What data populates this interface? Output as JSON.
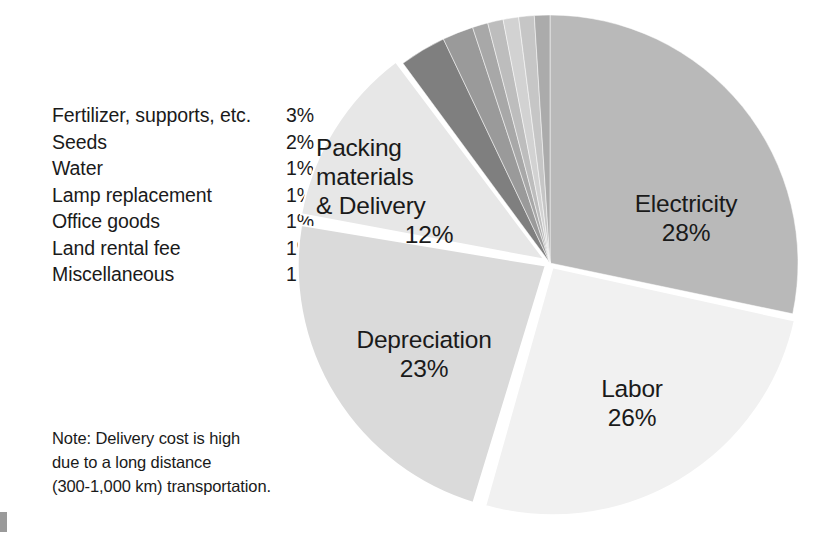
{
  "chart_data": {
    "type": "pie",
    "title": "",
    "unit": "%",
    "legend_position": "left",
    "categories": [
      "Electricity",
      "Labor",
      "Depreciation",
      "Packing materials & Delivery",
      "Fertilizer, supports, etc.",
      "Seeds",
      "Water",
      "Lamp replacement",
      "Office goods",
      "Land rental fee",
      "Miscellaneous"
    ],
    "values": [
      28,
      26,
      23,
      12,
      3,
      2,
      1,
      1,
      1,
      1,
      1
    ],
    "labels": [
      "28%",
      "26%",
      "23%",
      "12%",
      "3%",
      "2%",
      "1%",
      "1%",
      "1%",
      "1%",
      "1%"
    ],
    "colors": [
      "#b9b9b9",
      "#f1f1f1",
      "#dadada",
      "#e7e7e7",
      "#7f7f7f",
      "#9a9a9a",
      "#a8a8a8",
      "#bdbdbd",
      "#d2d2d2",
      "#c6c6c6",
      "#ababab"
    ],
    "slices": [
      {
        "name": "Electricity",
        "value": 28,
        "label": "28%",
        "color": "#b9b9b9"
      },
      {
        "name": "Labor",
        "value": 26,
        "label": "26%",
        "color": "#f1f1f1"
      },
      {
        "name": "Depreciation",
        "value": 23,
        "label": "23%",
        "color": "#dadada"
      },
      {
        "name": "Packing materials & Delivery",
        "value": 12,
        "label": "12%",
        "color": "#e7e7e7"
      },
      {
        "name": "Fertilizer, supports, etc.",
        "value": 3,
        "label": "3%",
        "color": "#7f7f7f"
      },
      {
        "name": "Seeds",
        "value": 2,
        "label": "2%",
        "color": "#9a9a9a"
      },
      {
        "name": "Water",
        "value": 1,
        "label": "1%",
        "color": "#a8a8a8"
      },
      {
        "name": "Lamp replacement",
        "value": 1,
        "label": "1%",
        "color": "#bdbdbd"
      },
      {
        "name": "Office goods",
        "value": 1,
        "label": "1%",
        "color": "#d2d2d2"
      },
      {
        "name": "Land rental fee",
        "value": 1,
        "label": "1%",
        "color": "#c6c6c6"
      },
      {
        "name": "Miscellaneous",
        "value": 1,
        "label": "1%",
        "color": "#ababab"
      }
    ]
  },
  "legend": {
    "rows": [
      {
        "label": "Fertilizer, supports, etc.",
        "value": "3%"
      },
      {
        "label": "Seeds",
        "value": "2%"
      },
      {
        "label": "Water",
        "value": "1%"
      },
      {
        "label": "Lamp replacement",
        "value": "1%"
      },
      {
        "label": "Office goods",
        "value": "1%"
      },
      {
        "label": "Land rental fee",
        "value": "1%"
      },
      {
        "label": "Miscellaneous",
        "value": "1%"
      }
    ]
  },
  "note": {
    "lines": [
      "Note: Delivery cost is high",
      "due to a long distance",
      "(300-1,000 km) transportation."
    ]
  },
  "pie_labels": {
    "electricity": {
      "name": "Electricity",
      "pct": "28%"
    },
    "packing": {
      "line1": "Packing",
      "line2": "materials",
      "line3": "& Delivery",
      "pct": "12%"
    },
    "depreciation": {
      "name": "Depreciation",
      "pct": "23%"
    },
    "labor": {
      "name": "Labor",
      "pct": "26%"
    }
  }
}
